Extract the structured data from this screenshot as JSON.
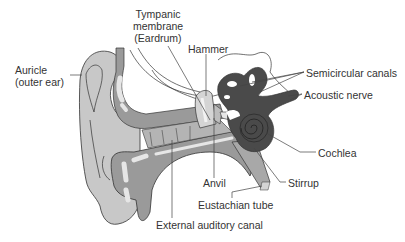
{
  "diagram": {
    "colors": {
      "background": "#ffffff",
      "outer_ear_fill": "#c8c8c8",
      "canal_fill": "#9a9a9a",
      "highlight_fill": "#e6e6e6",
      "inner_ear_fill": "#4a4a4a",
      "outline": "#333333",
      "leader_line": "#444444",
      "text": "#333333"
    },
    "labels": {
      "tympanic_line1": "Tympanic",
      "tympanic_line2": "membrane",
      "tympanic_line3": "(Eardrum)",
      "hammer": "Hammer",
      "auricle_line1": "Auricle",
      "auricle_line2": "(outer ear)",
      "semicircular": "Semicircular canals",
      "acoustic": "Acoustic nerve",
      "cochlea": "Cochlea",
      "stirrup": "Stirrup",
      "anvil": "Anvil",
      "eustachian": "Eustachian tube",
      "external_canal": "External auditory canal"
    }
  }
}
